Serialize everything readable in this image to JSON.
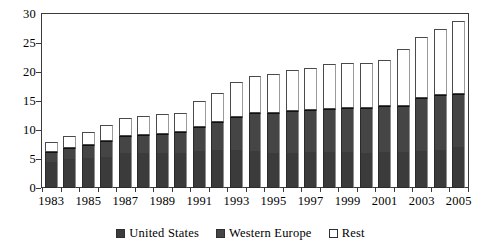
{
  "chart_data": {
    "type": "bar",
    "stacked": true,
    "title": "",
    "subtitle": "",
    "xlabel": "",
    "ylabel": "",
    "ylim": [
      0,
      30
    ],
    "ytick_values": [
      0,
      5,
      10,
      15,
      20,
      25,
      30
    ],
    "ytick_labels": [
      "0",
      "5",
      "10",
      "15",
      "20",
      "25",
      "30"
    ],
    "grid": false,
    "legend_position": "bottom",
    "categories": [
      "1983",
      "1984",
      "1985",
      "1986",
      "1987",
      "1988",
      "1989",
      "1990",
      "1991",
      "1992",
      "1993",
      "1994",
      "1995",
      "1996",
      "1997",
      "1998",
      "1999",
      "2000",
      "2001",
      "2002",
      "2003",
      "2004",
      "2005"
    ],
    "xtick_labels_shown": [
      "1983",
      "1985",
      "1987",
      "1989",
      "1991",
      "1993",
      "1995",
      "1997",
      "1999",
      "2001",
      "2003",
      "2005"
    ],
    "series": [
      {
        "name": "United States",
        "color": "#3b3b3b",
        "values": [
          4.4,
          5.0,
          5.2,
          5.4,
          6.0,
          6.0,
          6.0,
          6.1,
          6.4,
          6.5,
          6.5,
          6.4,
          6.1,
          6.1,
          6.2,
          6.2,
          6.2,
          6.1,
          6.2,
          6.2,
          6.4,
          6.6,
          7.0
        ]
      },
      {
        "name": "Western Europe",
        "color": "#454545",
        "values": [
          1.8,
          1.9,
          2.3,
          2.7,
          2.9,
          3.2,
          3.3,
          3.5,
          4.2,
          4.8,
          5.7,
          6.5,
          6.8,
          7.2,
          7.2,
          7.4,
          7.6,
          7.7,
          7.9,
          7.9,
          9.2,
          9.4,
          9.2
        ]
      },
      {
        "name": "Rest",
        "color": "#ffffff",
        "values": [
          1.8,
          2.0,
          2.2,
          2.8,
          3.1,
          3.2,
          3.4,
          3.4,
          4.4,
          5.0,
          6.1,
          6.4,
          6.8,
          7.0,
          7.3,
          7.7,
          7.7,
          7.8,
          7.9,
          9.9,
          10.4,
          11.5,
          12.6
        ]
      }
    ],
    "totals": [
      8.0,
      8.9,
      9.7,
      10.9,
      12.0,
      12.4,
      12.7,
      13.0,
      15.0,
      16.3,
      18.3,
      19.3,
      19.7,
      20.3,
      20.7,
      21.3,
      21.5,
      21.6,
      22.0,
      24.0,
      26.0,
      27.5,
      28.8
    ]
  },
  "legend": {
    "items": [
      {
        "label": "United States",
        "swatch": "us"
      },
      {
        "label": "Western Europe",
        "swatch": "we"
      },
      {
        "label": "Rest",
        "swatch": "rest"
      }
    ]
  }
}
